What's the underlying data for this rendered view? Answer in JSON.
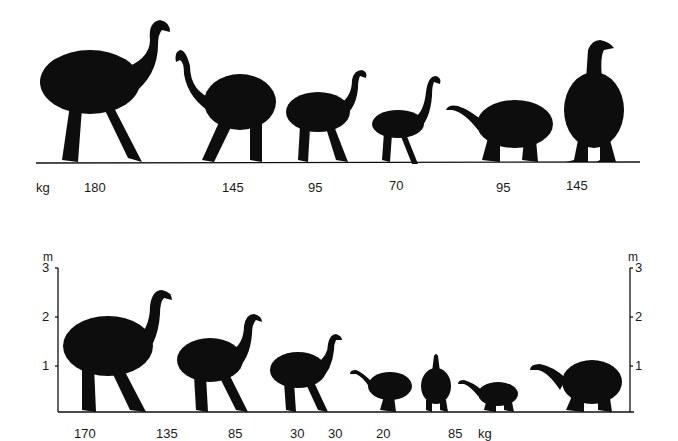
{
  "top_panel": {
    "unit_label": "kg",
    "birds": [
      {
        "name": "moa-1",
        "weight": "180"
      },
      {
        "name": "moa-2",
        "weight": "145"
      },
      {
        "name": "moa-3",
        "weight": "95"
      },
      {
        "name": "moa-4",
        "weight": "70"
      },
      {
        "name": "moa-5",
        "weight": "95"
      },
      {
        "name": "moa-6",
        "weight": "145"
      }
    ]
  },
  "bottom_panel": {
    "unit_label": "kg",
    "height_axis": {
      "unit": "m",
      "ticks": [
        "3",
        "2",
        "1"
      ]
    },
    "birds": [
      {
        "name": "moa-a",
        "weight": "170"
      },
      {
        "name": "moa-b",
        "weight": "135"
      },
      {
        "name": "moa-c",
        "weight": "85"
      },
      {
        "name": "moa-d",
        "weight": "30"
      },
      {
        "name": "moa-e",
        "weight": "30"
      },
      {
        "name": "moa-f",
        "weight": "20"
      },
      {
        "name": "moa-g",
        "weight": "85"
      }
    ]
  },
  "colors": {
    "silhouette": "#0d0d0d",
    "background": "#ffffff"
  }
}
